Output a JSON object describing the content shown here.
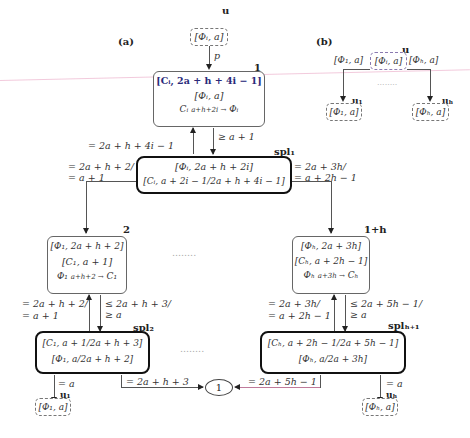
{
  "panel_a": {
    "label": "(a)",
    "root": {
      "label": "u",
      "content": "[Φᵢ, a]",
      "edge_label": "p"
    },
    "node1": {
      "index": "1",
      "line1": "[Cᵢ, 2a + h + 4i − 1]",
      "line2": "[Φᵢ, a]",
      "line3_left": "Cᵢ",
      "line3_arrow": "a+h+2i →",
      "line3_right": "Φᵢ"
    },
    "edge_node1_spl1_down": "≥ a + 1",
    "edge_spl1_node1_up": "= 2a + h + 4i − 1",
    "spl1": {
      "label": "spl₁",
      "line1": "[Φᵢ, 2a + h + 2i]",
      "line2": "[Cᵢ, a + 2i − 1/2a + h + 4i − 1]"
    },
    "edge_spl1_left": [
      "= 2a + h + 2/",
      "= a + 1"
    ],
    "edge_spl1_right": [
      "= 2a + 3h/",
      "= a + 2h − 1"
    ],
    "node2": {
      "index": "2",
      "line1": "[Φ₁, 2a + h + 2]",
      "line2": "[C₁, a + 1]",
      "line3_left": "Φ₁",
      "line3_arrow": "a+h+2 →",
      "line3_right": "C₁"
    },
    "edge_node2_up": [
      "= 2a + h + 2/",
      "= a + 1"
    ],
    "edge_node2_down": [
      "≤ 2a + h + 3/",
      "≥ a"
    ],
    "spl2": {
      "label": "spl₂",
      "line1": "[C₁, a + 1/2a + h + 3]",
      "line2": "[Φ₁, a/2a + h + 2]"
    },
    "edge_spl2_u1": "= a",
    "u1": {
      "label": "u₁",
      "content": "[Φ₁, a]"
    },
    "edge_spl2_circle": "= 2a + h + 3",
    "circle": "1",
    "node1h": {
      "index": "1+h",
      "line1": "[Φₕ, 2a + 3h]",
      "line2": "[Cₕ, a + 2h − 1]",
      "line3_left": "Φₕ",
      "line3_arrow": "a+3h →",
      "line3_right": "Cₕ"
    },
    "edge_node1h_up": [
      "= 2a + 3h/",
      "= a + 2h − 1"
    ],
    "edge_node1h_down": [
      "≤ 2a + 5h − 1/",
      "≥ a"
    ],
    "splh1": {
      "label": "splₕ₊₁",
      "line1": "[Cₕ, a + 2h − 1/2a + 5h − 1]",
      "line2": "[Φₕ, a/2a + 3h]"
    },
    "edge_splh1_circle": "= 2a + 5h − 1",
    "edge_splh1_uh": "= a",
    "uh": {
      "label": "uₕ",
      "content": "[Φₕ, a]"
    },
    "ellipsis": "........"
  },
  "panel_b": {
    "label": "(b)",
    "root_label": "u",
    "left_text": "[Φ₁, a]",
    "center_text": "[Φᵢ, a]",
    "right_text": "[Φₕ, a]",
    "u1": {
      "label": "u₁",
      "content": "[Φ₁, a]"
    },
    "uh": {
      "label": "uₕ",
      "content": "[Φₕ, a]"
    },
    "ellipsis": "........"
  }
}
